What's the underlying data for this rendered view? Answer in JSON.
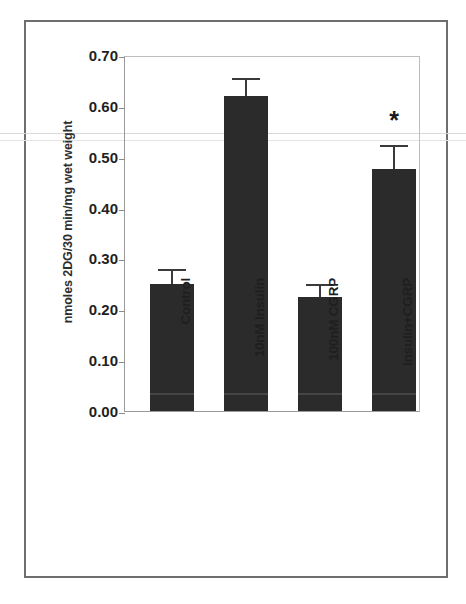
{
  "figure": {
    "border_color": "#6e6e6e",
    "bar_color": "#2b2b2b"
  },
  "chart_data": {
    "type": "bar",
    "title": "",
    "xlabel": "",
    "ylabel": "nmoles 2DG/30 min/mg wet weight",
    "categories": [
      "Control",
      "10nM Insulin",
      "100nM CGRP",
      "Insulin+CGRP"
    ],
    "values": [
      0.25,
      0.62,
      0.225,
      0.475
    ],
    "errors": [
      0.025,
      0.03,
      0.02,
      0.045
    ],
    "annotations": [
      "",
      "",
      "",
      "*"
    ],
    "ylim": [
      0.0,
      0.7
    ],
    "yticks": [
      0.0,
      0.1,
      0.2,
      0.3,
      0.4,
      0.5,
      0.6,
      0.7
    ],
    "ytick_labels": [
      "0.00",
      "0.10",
      "0.20",
      "0.30",
      "0.40",
      "0.50",
      "0.60",
      "0.70"
    ],
    "grid": false,
    "legend": null,
    "series": [
      {
        "name": "2-deoxyglucose uptake",
        "values": [
          0.25,
          0.62,
          0.225,
          0.475
        ],
        "errors": [
          0.025,
          0.03,
          0.02,
          0.045
        ]
      }
    ]
  }
}
